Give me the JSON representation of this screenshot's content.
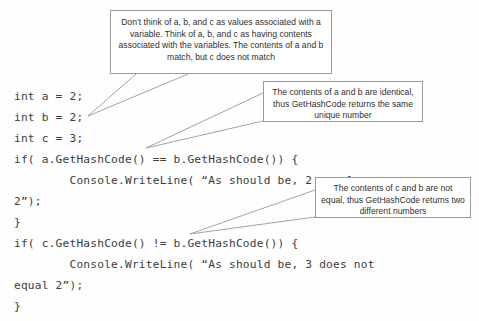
{
  "page": {
    "background_color": "#fefefe",
    "code_text_color": "#3c3c3c",
    "callout_border_color": "#9a9a9a",
    "callout_text_color": "#2f2f2f"
  },
  "code": {
    "lines": [
      "int a = 2;",
      "int b = 2;",
      "int c = 3;",
      "if( a.GetHashCode() == b.GetHashCode()) {",
      "        Console.WriteLine( “As should be, 2 equals",
      "2”);",
      "}",
      "if( c.GetHashCode() != b.GetHashCode()) {",
      "        Console.WriteLine( “As should be, 3 does not",
      "equal 2”);",
      "}"
    ]
  },
  "callouts": [
    {
      "id": "variables",
      "text": "Don’t think of a, b, and c as values associated with a variable. Think of a, b, and c as having contents associated with the variables. The contents of a and b match, but c does not match"
    },
    {
      "id": "identical",
      "text": "The contents of a and b are identical, thus GetHashCode returns the same unique number"
    },
    {
      "id": "notequal",
      "text": "The contents of c and b are not equal, thus GetHashCode returns two different numbers"
    }
  ]
}
